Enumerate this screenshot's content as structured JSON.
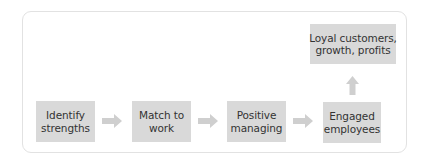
{
  "diagram": {
    "title": "",
    "colors": {
      "box_fill": "#d9d9d9",
      "arrow_fill": "#cfcfcf",
      "text": "#333333",
      "frame_border": "#e2e2e2"
    },
    "nodes": [
      {
        "id": "identify-strengths",
        "lines": [
          "Identify",
          "strengths"
        ]
      },
      {
        "id": "match-to-work",
        "lines": [
          "Match to",
          "work"
        ]
      },
      {
        "id": "positive-managing",
        "lines": [
          "Positive",
          "managing"
        ]
      },
      {
        "id": "engaged-employees",
        "lines": [
          "Engaged",
          "employees"
        ]
      },
      {
        "id": "loyal-customers",
        "lines": [
          "Loyal customers,",
          "growth, profits"
        ]
      }
    ],
    "edges": [
      {
        "from": "identify-strengths",
        "to": "match-to-work",
        "direction": "right"
      },
      {
        "from": "match-to-work",
        "to": "positive-managing",
        "direction": "right"
      },
      {
        "from": "positive-managing",
        "to": "engaged-employees",
        "direction": "right"
      },
      {
        "from": "engaged-employees",
        "to": "loyal-customers",
        "direction": "up"
      }
    ]
  }
}
